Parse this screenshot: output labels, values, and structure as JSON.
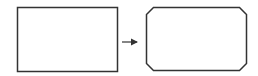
{
  "diagram": {
    "stroke_color": "#333333",
    "background": "#ffffff",
    "shapes": [
      {
        "id": "source-rect",
        "type": "rectangle",
        "x": 17,
        "y": 7,
        "width": 100,
        "height": 64
      },
      {
        "id": "target-chamfered-rect",
        "type": "chamfered-rectangle",
        "x": 146,
        "y": 7,
        "width": 100,
        "height": 63,
        "chamfer": 7
      }
    ],
    "arrow": {
      "x1": 122,
      "y1": 42,
      "x2": 138,
      "y2": 42
    }
  }
}
